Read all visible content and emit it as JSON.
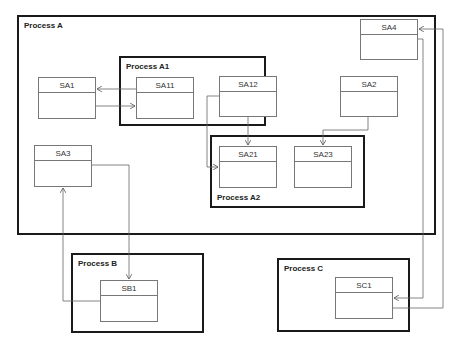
{
  "processes": {
    "A": {
      "label": "Process A"
    },
    "A1": {
      "label": "Process A1"
    },
    "A2": {
      "label": "Process A2"
    },
    "B": {
      "label": "Process B"
    },
    "C": {
      "label": "Process C"
    }
  },
  "boxes": {
    "SA1": {
      "label": "SA1"
    },
    "SA11": {
      "label": "SA11"
    },
    "SA12": {
      "label": "SA12"
    },
    "SA2": {
      "label": "SA2"
    },
    "SA3": {
      "label": "SA3"
    },
    "SA4": {
      "label": "SA4"
    },
    "SA21": {
      "label": "SA21"
    },
    "SA23": {
      "label": "SA23"
    },
    "SB1": {
      "label": "SB1"
    },
    "SC1": {
      "label": "SC1"
    }
  },
  "connections": [
    {
      "from": "SA11",
      "to": "SA1"
    },
    {
      "from": "SA1",
      "to": "SA11"
    },
    {
      "from": "SA12",
      "to": "SA21"
    },
    {
      "from": "SA12",
      "to": "SA21",
      "note": "left side entry"
    },
    {
      "from": "SA2",
      "to": "SA23"
    },
    {
      "from": "SA3",
      "to": "SB1"
    },
    {
      "from": "SB1",
      "to": "SA3"
    },
    {
      "from": "SA4",
      "to": "SC1"
    },
    {
      "from": "SC1",
      "to": "SA4"
    }
  ],
  "colors": {
    "process_border": "#1a1a1a",
    "box_border": "#777777",
    "wire": "#666666"
  }
}
